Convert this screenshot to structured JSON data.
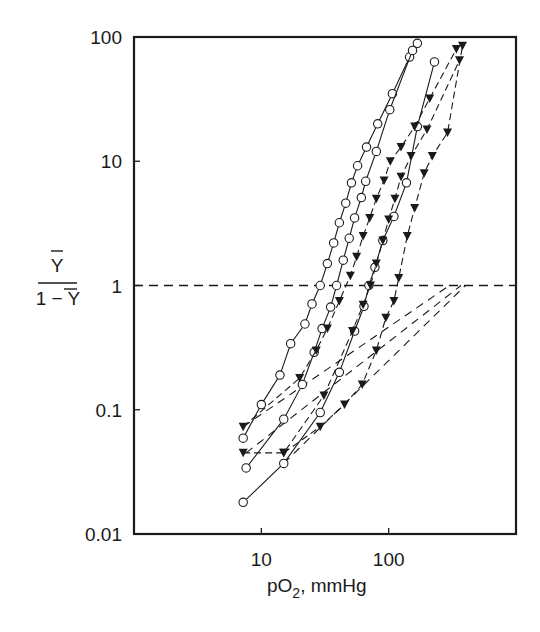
{
  "chart_data": {
    "type": "scatter",
    "title": "",
    "xlabel": "pO2, mmHg",
    "xlabel_parts": {
      "main": "pO",
      "sub": "2",
      "rest": ", mmHg"
    },
    "ylabel": "Ȳ / (1 − Ȳ)",
    "ylabel_parts": {
      "numerator": "Y",
      "denominator": "1 − Y"
    },
    "xscale": "log",
    "yscale": "log",
    "xlim": [
      1,
      1000
    ],
    "ylim": [
      0.01,
      100
    ],
    "xticks": [
      {
        "value": 10,
        "label": "10"
      },
      {
        "value": 100,
        "label": "100"
      }
    ],
    "yticks": [
      {
        "value": 0.01,
        "label": "0.01"
      },
      {
        "value": 0.1,
        "label": "0.1"
      },
      {
        "value": 1,
        "label": "1"
      },
      {
        "value": 10,
        "label": "10"
      },
      {
        "value": 100,
        "label": "100"
      }
    ],
    "grid": false,
    "legend": null,
    "reference_lines": [
      {
        "type": "horizontal",
        "y": 1,
        "style": "dashed"
      },
      {
        "type": "asymptote",
        "style": "dashed",
        "points": [
          [
            7.2,
            0.073
          ],
          [
            300,
            1
          ]
        ]
      },
      {
        "type": "asymptote",
        "style": "dashed",
        "points": [
          [
            7.6,
            0.045
          ],
          [
            370,
            1
          ]
        ]
      },
      {
        "type": "asymptote",
        "style": "dashed",
        "points": [
          [
            15,
            0.037
          ],
          [
            400,
            1
          ]
        ]
      }
    ],
    "series": [
      {
        "name": "circles-1",
        "marker": "open-circle",
        "line": "solid",
        "x": [
          7.2,
          10,
          14,
          17,
          22,
          25,
          29,
          33,
          37,
          41,
          46,
          51,
          57,
          67,
          82,
          107,
          146,
          168
        ],
        "y": [
          0.059,
          0.11,
          0.19,
          0.34,
          0.49,
          0.71,
          1.0,
          1.5,
          2.2,
          3.2,
          4.6,
          6.7,
          9.2,
          13,
          20,
          35,
          69,
          89
        ]
      },
      {
        "name": "circles-2",
        "marker": "open-circle",
        "line": "solid",
        "x": [
          7.6,
          15,
          21,
          26,
          30,
          35,
          39,
          44,
          49,
          54,
          61,
          66,
          80,
          102,
          154
        ],
        "y": [
          0.034,
          0.084,
          0.16,
          0.29,
          0.45,
          0.67,
          1.0,
          1.6,
          2.4,
          3.5,
          5.1,
          6.9,
          12,
          26,
          78
        ]
      },
      {
        "name": "circles-3",
        "marker": "open-circle",
        "line": "solid",
        "x": [
          7.2,
          15,
          29,
          41,
          54,
          64,
          70,
          78,
          90,
          110,
          138,
          168,
          229
        ],
        "y": [
          0.018,
          0.037,
          0.095,
          0.2,
          0.43,
          0.68,
          1.0,
          1.4,
          2.3,
          3.6,
          6.7,
          19,
          63
        ]
      },
      {
        "name": "triangles-1",
        "marker": "filled-triangle-down",
        "line": "dashed",
        "x": [
          7.2,
          20,
          27,
          33,
          41,
          50,
          56,
          63,
          71,
          80,
          92,
          103,
          125,
          160,
          210,
          340
        ],
        "y": [
          0.073,
          0.18,
          0.3,
          0.45,
          0.75,
          1.2,
          1.7,
          2.5,
          3.5,
          5.0,
          7.0,
          10,
          13,
          19,
          32,
          80
        ]
      },
      {
        "name": "triangles-2",
        "marker": "filled-triangle-down",
        "line": "dashed",
        "x": [
          7.2,
          15,
          31,
          52,
          63,
          72,
          80,
          90,
          100,
          112,
          125,
          150,
          200,
          360
        ],
        "y": [
          0.045,
          0.045,
          0.13,
          0.43,
          0.7,
          1.0,
          1.5,
          2.3,
          3.4,
          5.0,
          7.5,
          11,
          18,
          65
        ]
      },
      {
        "name": "triangles-3",
        "marker": "filled-triangle-down",
        "line": "dashed",
        "x": [
          15,
          29,
          45,
          62,
          80,
          95,
          110,
          120,
          140,
          160,
          190,
          220,
          290,
          380
        ],
        "y": [
          0.045,
          0.073,
          0.11,
          0.16,
          0.3,
          0.55,
          0.75,
          1.15,
          2.5,
          4.2,
          8.0,
          11,
          17,
          85
        ]
      }
    ]
  },
  "layout": {
    "plot_left": 134,
    "plot_right": 516,
    "plot_top": 37,
    "plot_bottom": 534,
    "line_color": "#1a1a1a"
  }
}
